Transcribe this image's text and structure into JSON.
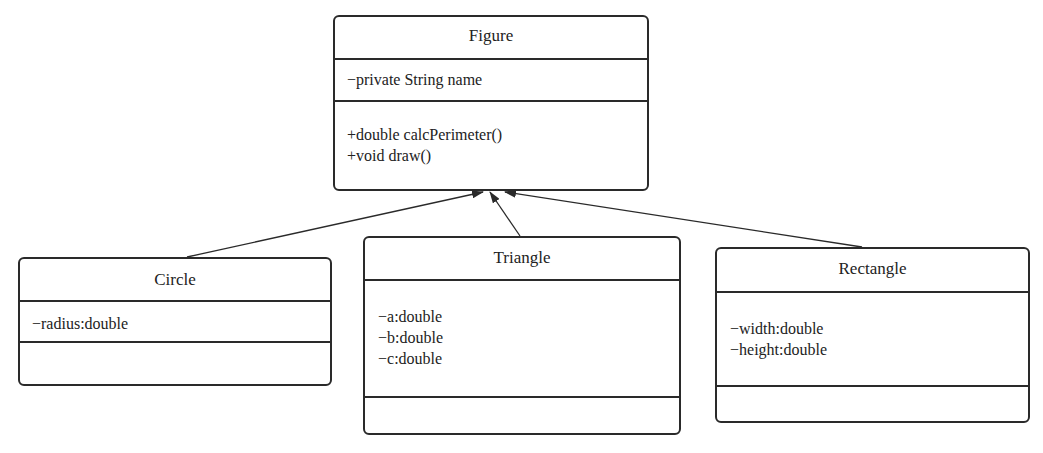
{
  "diagram": {
    "type": "uml-class-diagram",
    "classes": [
      {
        "id": "figure",
        "name": "Figure",
        "attributes": [
          "−private String name"
        ],
        "methods": [
          "+double calcPerimeter()",
          "+void draw()"
        ]
      },
      {
        "id": "circle",
        "name": "Circle",
        "attributes": [
          "−radius:double"
        ],
        "methods": []
      },
      {
        "id": "triangle",
        "name": "Triangle",
        "attributes": [
          "−a:double",
          "−b:double",
          "−c:double"
        ],
        "methods": []
      },
      {
        "id": "rectangle",
        "name": "Rectangle",
        "attributes": [
          "−width:double",
          "−height:double"
        ],
        "methods": []
      }
    ],
    "relationships": [
      {
        "from": "Circle",
        "to": "Figure",
        "type": "generalization"
      },
      {
        "from": "Triangle",
        "to": "Figure",
        "type": "generalization"
      },
      {
        "from": "Rectangle",
        "to": "Figure",
        "type": "generalization"
      }
    ],
    "colors": {
      "line": "#2a2a2a",
      "background": "#ffffff",
      "text": "#222222"
    }
  }
}
